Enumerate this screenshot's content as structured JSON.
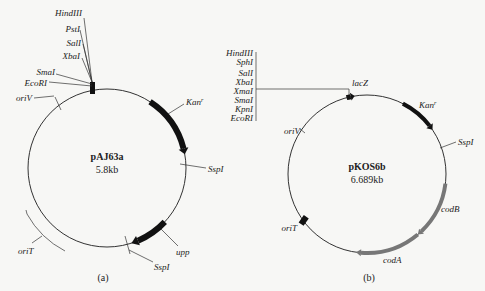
{
  "panel_a": {
    "caption": "(a)",
    "plasmid_name": "pAJ63a",
    "plasmid_size": "5.8kb",
    "mcs_sites": [
      "HindIII",
      "PstI",
      "SalI",
      "XbaI",
      "SmaI",
      "EcoRI"
    ],
    "features": {
      "oriV": "oriV",
      "kan": "Kan",
      "kan_sup": "r",
      "sspI_1": "SspI",
      "upp": "upp",
      "sspI_2": "SspI",
      "oriT": "oriT"
    }
  },
  "panel_b": {
    "caption": "(b)",
    "plasmid_name": "pKOS6b",
    "plasmid_size": "6.689kb",
    "mcs_sites": [
      "HindIII",
      "SphI",
      "SalI",
      "XbaI",
      "XmaI",
      "SmaI",
      "KpnI",
      "EcoRI"
    ],
    "features": {
      "lacZ": "lacZ",
      "kan": "Kan",
      "kan_sup": "r",
      "oriV": "oriV",
      "sspI": "SspI",
      "codB": "codB",
      "codA": "codA",
      "oriT": "oriT"
    }
  },
  "colors": {
    "line": "#333333",
    "black_feature": "#111111",
    "grey_feature": "#777777",
    "background": "#f7f7f5"
  }
}
